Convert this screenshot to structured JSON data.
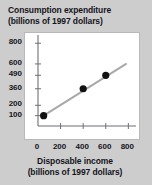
{
  "figure": {
    "background_color": "#cdcdcd",
    "panel_color": "#ffffff"
  },
  "title": {
    "line1": "Consumption expenditure",
    "line2": "(billions of 1997 dollars)"
  },
  "xcaption": {
    "line1": "Disposable income",
    "line2": "(billions of 1997 dollars)"
  },
  "chart_data": {
    "type": "scatter",
    "title": "Consumption expenditure (billions of 1997 dollars)",
    "xlabel": "Disposable income (billions of 1997 dollars)",
    "ylabel": "Consumption expenditure (billions of 1997 dollars)",
    "xlim": [
      0,
      850
    ],
    "ylim": [
      0,
      870
    ],
    "grid": false,
    "legend": null,
    "xticks": [
      0,
      200,
      400,
      600,
      800
    ],
    "xtick_labels": [
      "0",
      "200",
      "400",
      "600",
      "800"
    ],
    "yticks": [
      100,
      200,
      360,
      490,
      600,
      800
    ],
    "ytick_labels": [
      "100",
      "200",
      "360",
      "490",
      "600",
      "800"
    ],
    "point_color": "#111111",
    "line_color": "#a8a8a8",
    "points": [
      {
        "x": 50,
        "y": 100
      },
      {
        "x": 400,
        "y": 360
      },
      {
        "x": 600,
        "y": 490
      }
    ],
    "trend_line": {
      "x": [
        50,
        780
      ],
      "y": [
        100,
        600
      ]
    }
  }
}
